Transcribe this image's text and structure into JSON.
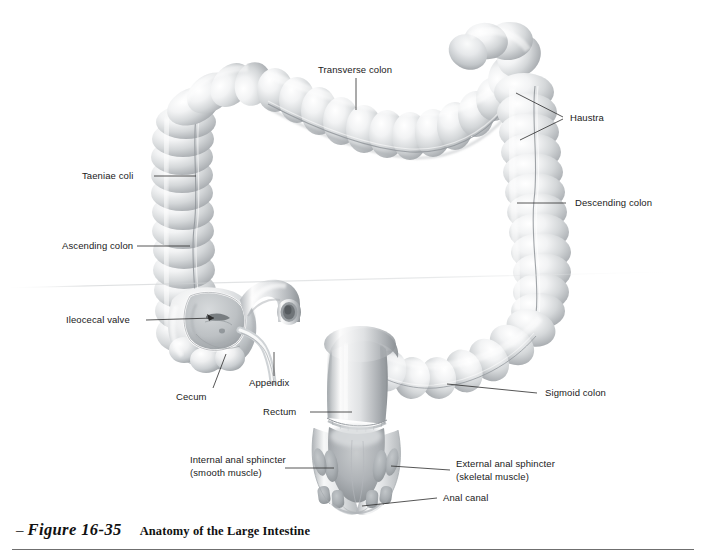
{
  "figure": {
    "dash": "–",
    "number": "Figure 16-35",
    "title": "Anatomy of the Large Intestine",
    "style": "grayscale-airbrush-anatomical-illustration"
  },
  "labels": {
    "transverse_colon": "Transverse colon",
    "haustra": "Haustra",
    "taeniae_coli": "Taeniae coli",
    "ascending_colon": "Ascending colon",
    "descending_colon": "Descending colon",
    "ileocecal_valve": "Ileocecal valve",
    "cecum": "Cecum",
    "appendix": "Appendix",
    "rectum": "Rectum",
    "sigmoid_colon": "Sigmoid colon",
    "internal_anal_sphincter_l1": "Internal anal sphincter",
    "internal_anal_sphincter_l2": "(smooth muscle)",
    "external_anal_sphincter_l1": "External anal sphincter",
    "external_anal_sphincter_l2": "(skeletal muscle)",
    "anal_canal": "Anal canal"
  },
  "colors": {
    "page_background": "#ffffff",
    "text": "#1a1a1a",
    "leader_line": "#2b2b2b",
    "organ_light": "#fbfbfb",
    "organ_mid": "#d6d8da",
    "organ_shadow": "#9ea2a6",
    "organ_deep": "#7d8286",
    "muscle_tone": "#b6babd",
    "caption_rule": "#6f6f6f"
  }
}
